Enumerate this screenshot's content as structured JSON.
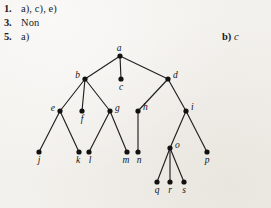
{
  "page": {
    "background_color": "#f3f1ed",
    "ink_color": "#131313"
  },
  "answers": [
    {
      "number": "1.",
      "text": "a), c), e)"
    },
    {
      "number": "3.",
      "text": "Non"
    },
    {
      "number": "5.",
      "text": "a)"
    }
  ],
  "right_answer": {
    "label": "b)",
    "value": "c"
  },
  "tree": {
    "type": "rooted-tree",
    "root": "a",
    "node_radius": 2.6,
    "nodes": [
      {
        "id": "a",
        "label": "a",
        "x": 120,
        "y": 56,
        "label_dx": -1,
        "label_dy": -5,
        "label_anchor": "middle"
      },
      {
        "id": "b",
        "label": "b",
        "x": 85,
        "y": 79,
        "label_dx": -5,
        "label_dy": -1,
        "label_anchor": "end"
      },
      {
        "id": "c",
        "label": "c",
        "x": 121,
        "y": 79,
        "label_dx": 0,
        "label_dy": 11,
        "label_anchor": "middle"
      },
      {
        "id": "d",
        "label": "d",
        "x": 168,
        "y": 79,
        "label_dx": 5,
        "label_dy": -1,
        "label_anchor": "start"
      },
      {
        "id": "e",
        "label": "e",
        "x": 60,
        "y": 111,
        "label_dx": -5,
        "label_dy": 0,
        "label_anchor": "end"
      },
      {
        "id": "f",
        "label": "f",
        "x": 82,
        "y": 111,
        "label_dx": 0,
        "label_dy": 11,
        "label_anchor": "middle"
      },
      {
        "id": "g",
        "label": "g",
        "x": 110,
        "y": 111,
        "label_dx": 5,
        "label_dy": 0,
        "label_anchor": "start"
      },
      {
        "id": "h",
        "label": "h",
        "x": 138,
        "y": 111,
        "label_dx": 5,
        "label_dy": -1,
        "label_anchor": "start"
      },
      {
        "id": "i",
        "label": "i",
        "x": 186,
        "y": 111,
        "label_dx": 5,
        "label_dy": -1,
        "label_anchor": "start"
      },
      {
        "id": "j",
        "label": "j",
        "x": 39,
        "y": 152,
        "label_dx": 0,
        "label_dy": 11,
        "label_anchor": "middle"
      },
      {
        "id": "k",
        "label": "k",
        "x": 79,
        "y": 152,
        "label_dx": -1,
        "label_dy": 11,
        "label_anchor": "middle"
      },
      {
        "id": "l",
        "label": "l",
        "x": 89,
        "y": 152,
        "label_dx": 1,
        "label_dy": 11,
        "label_anchor": "middle"
      },
      {
        "id": "m",
        "label": "m",
        "x": 127,
        "y": 152,
        "label_dx": -1,
        "label_dy": 11,
        "label_anchor": "middle"
      },
      {
        "id": "n",
        "label": "n",
        "x": 138,
        "y": 152,
        "label_dx": 1,
        "label_dy": 11,
        "label_anchor": "middle"
      },
      {
        "id": "o",
        "label": "o",
        "x": 170,
        "y": 148,
        "label_dx": 5,
        "label_dy": 0,
        "label_anchor": "start"
      },
      {
        "id": "p",
        "label": "p",
        "x": 207,
        "y": 152,
        "label_dx": 0,
        "label_dy": 11,
        "label_anchor": "middle"
      },
      {
        "id": "q",
        "label": "q",
        "x": 157,
        "y": 182,
        "label_dx": 0,
        "label_dy": 11,
        "label_anchor": "middle"
      },
      {
        "id": "r",
        "label": "r",
        "x": 170,
        "y": 182,
        "label_dx": 0,
        "label_dy": 11,
        "label_anchor": "middle"
      },
      {
        "id": "s",
        "label": "s",
        "x": 184,
        "y": 182,
        "label_dx": 0,
        "label_dy": 11,
        "label_anchor": "middle"
      }
    ],
    "edges": [
      [
        "a",
        "b"
      ],
      [
        "a",
        "c"
      ],
      [
        "a",
        "d"
      ],
      [
        "b",
        "e"
      ],
      [
        "b",
        "f"
      ],
      [
        "b",
        "g"
      ],
      [
        "d",
        "h"
      ],
      [
        "d",
        "i"
      ],
      [
        "e",
        "j"
      ],
      [
        "e",
        "k"
      ],
      [
        "g",
        "l"
      ],
      [
        "g",
        "m"
      ],
      [
        "h",
        "n"
      ],
      [
        "i",
        "o"
      ],
      [
        "i",
        "p"
      ],
      [
        "o",
        "q"
      ],
      [
        "o",
        "r"
      ],
      [
        "o",
        "s"
      ]
    ]
  }
}
